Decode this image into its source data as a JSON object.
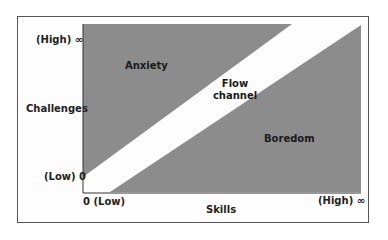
{
  "diagram": {
    "y_axis": {
      "label": "Challenges",
      "high": "(High) ∞",
      "low": "(Low) 0"
    },
    "x_axis": {
      "label": "Skills",
      "low": "0 (Low)",
      "high": "(High) ∞"
    },
    "regions": {
      "anxiety": "Anxiety",
      "flow_line1": "Flow",
      "flow_line2": "channel",
      "boredom": "Boredom"
    },
    "colors": {
      "region_fill": "#8c8c8c",
      "channel": "#ffffff",
      "axis": "#333333",
      "frame": "#555555"
    }
  }
}
